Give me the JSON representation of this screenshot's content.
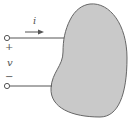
{
  "diagram": {
    "type": "circuit-element",
    "element_shape": "generic two-terminal element (blob)",
    "labels": {
      "current": "i",
      "voltage": "v",
      "positive_terminal": "+",
      "negative_terminal": "−"
    },
    "colors": {
      "element_fill": "#c9c9c9",
      "stroke": "#555555",
      "background": "#ffffff"
    }
  }
}
